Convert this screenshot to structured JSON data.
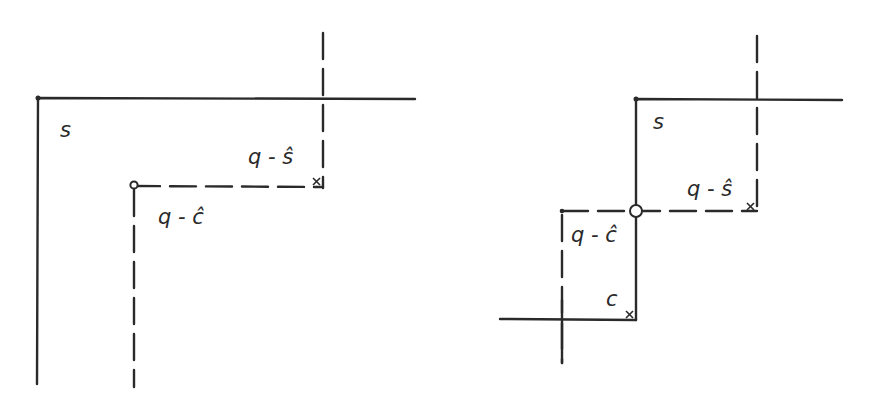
{
  "figure": {
    "left_panel": {
      "labels": {
        "set": "s",
        "q_minus_s_hat": "q - ŝ",
        "q_minus_c_hat": "q - ĉ"
      }
    },
    "right_panel": {
      "labels": {
        "set": "s",
        "q_minus_s_hat": "q - ŝ",
        "q_minus_c_hat": "q - ĉ",
        "point_c": "c"
      }
    },
    "colors": {
      "ink": "#2a2a2a",
      "background": "#ffffff"
    }
  }
}
